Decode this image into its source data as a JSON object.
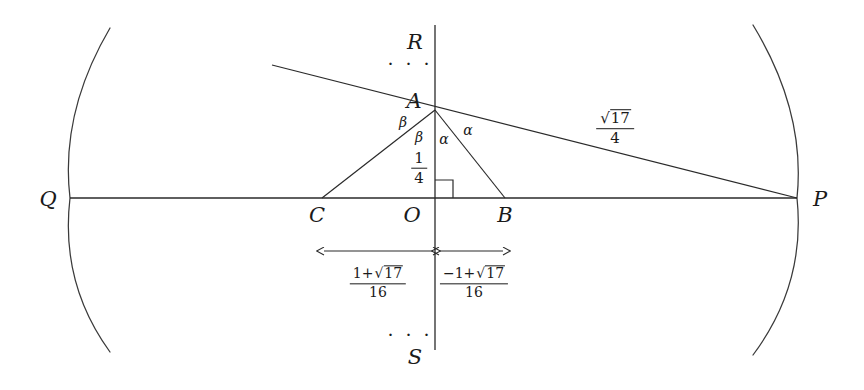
{
  "figure": {
    "background_color": "#ffffff",
    "stroke_color": "#2a2a2a",
    "width": 864,
    "height": 390
  },
  "points": {
    "Q": {
      "label": "Q",
      "x": 48,
      "y": 199
    },
    "P": {
      "label": "P",
      "x": 820,
      "y": 199
    },
    "R": {
      "label": "R",
      "x": 415,
      "y": 42
    },
    "S": {
      "label": "S",
      "x": 415,
      "y": 357
    },
    "A": {
      "label": "A",
      "x": 414,
      "y": 101
    },
    "O": {
      "label": "O",
      "x": 412,
      "y": 215
    },
    "B": {
      "label": "B",
      "x": 505,
      "y": 215
    },
    "C": {
      "label": "C",
      "x": 317,
      "y": 215
    }
  },
  "angles": {
    "beta_outer": {
      "label": "β",
      "x": 403,
      "y": 122
    },
    "beta_inner": {
      "label": "β",
      "x": 419,
      "y": 137
    },
    "alpha_inner": {
      "label": "α",
      "x": 444,
      "y": 139
    },
    "alpha_outer": {
      "label": "α",
      "x": 468,
      "y": 130
    }
  },
  "measures": {
    "height_OA": {
      "numerator": "1",
      "denominator": "4",
      "x": 419,
      "y": 168
    },
    "hypotenuse_AP": {
      "numerator_prefix": "",
      "numerator_radicand": "17",
      "denominator": "4",
      "x": 615,
      "y": 128
    },
    "segment_CO": {
      "numerator_prefix": "1+",
      "numerator_radicand": "17",
      "denominator": "16",
      "x": 378,
      "y": 283
    },
    "segment_OB": {
      "numerator_prefix": "−1+",
      "numerator_radicand": "17",
      "denominator": "16",
      "x": 474,
      "y": 283
    }
  },
  "ellipses": {
    "top_dots": {
      "label": "· · ·",
      "x": 410,
      "y": 63
    },
    "bottom_dots": {
      "label": "· · ·",
      "x": 410,
      "y": 334
    }
  },
  "geometry": {
    "horizontal_axis": {
      "x1": 70,
      "y1": 198,
      "x2": 797,
      "y2": 198
    },
    "vertical_axis": {
      "x1": 435,
      "y1": 25,
      "x2": 435,
      "y2": 350
    },
    "line_through_A_to_P": {
      "x1": 272,
      "y1": 65,
      "x2": 797,
      "y2": 198
    },
    "triangle": {
      "apex": [
        435,
        110
      ],
      "left": [
        322,
        198
      ],
      "right": [
        505,
        198
      ]
    },
    "altitude": {
      "x1": 435,
      "y1": 110,
      "x2": 435,
      "y2": 198
    },
    "right_angle_marker": {
      "x": 435,
      "y": 198,
      "size": 18
    },
    "left_arc": {
      "top": [
        110,
        28
      ],
      "vertex": [
        70,
        198
      ],
      "bottom": [
        110,
        352
      ]
    },
    "right_arc": {
      "top": [
        753,
        25
      ],
      "vertex": [
        797,
        198
      ],
      "bottom": [
        753,
        355
      ]
    },
    "dimension_arrow_left": {
      "x1": 322,
      "x2": 434,
      "y": 251
    },
    "dimension_arrow_right": {
      "x1": 437,
      "x2": 505,
      "y": 251
    }
  }
}
